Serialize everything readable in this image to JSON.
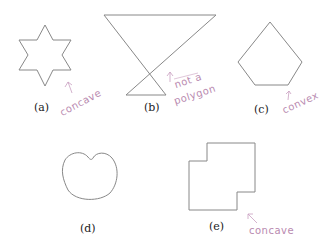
{
  "figure": {
    "panels": [
      {
        "id": "a",
        "caption": "(a)",
        "shape": "six-pointed star",
        "annotation": "concave"
      },
      {
        "id": "b",
        "caption": "(b)",
        "shape": "self-intersecting bowtie",
        "annotation_line1": "not a",
        "annotation_line2": "polygon"
      },
      {
        "id": "c",
        "caption": "(c)",
        "shape": "pentagon",
        "annotation": "convex"
      },
      {
        "id": "d",
        "caption": "(d)",
        "shape": "kidney curve"
      },
      {
        "id": "e",
        "caption": "(e)",
        "shape": "stepped rectilinear polygon",
        "annotation": "concave"
      }
    ],
    "colors": {
      "line": "#888888",
      "annotation": "#b98ab0",
      "text": "#222222"
    }
  }
}
